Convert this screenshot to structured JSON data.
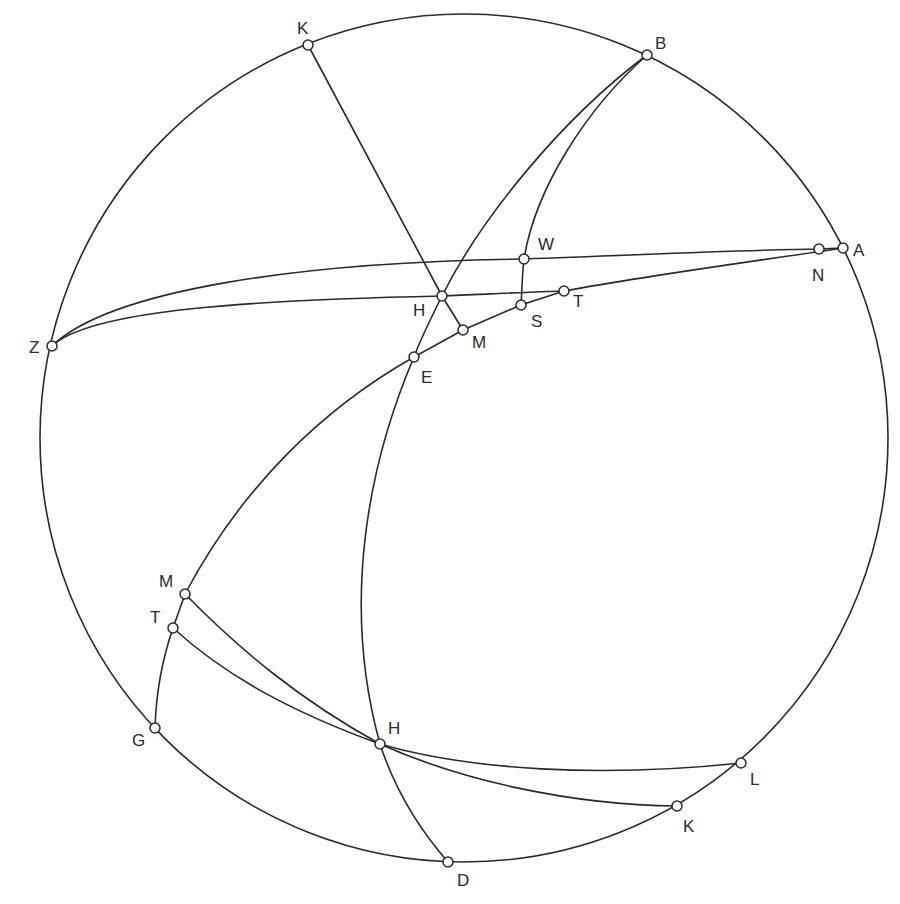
{
  "figure": {
    "type": "spherical-geometry-diagram",
    "circle": {
      "cx": 464,
      "cy": 438,
      "r": 424
    },
    "points": [
      {
        "id": "K_top",
        "label": "K",
        "x": 308,
        "y": 45,
        "lx": 297,
        "ly": 34
      },
      {
        "id": "B",
        "label": "B",
        "x": 647,
        "y": 55,
        "lx": 655,
        "ly": 49
      },
      {
        "id": "A",
        "label": "A",
        "x": 843,
        "y": 248,
        "lx": 853,
        "ly": 256
      },
      {
        "id": "N",
        "label": "N",
        "x": 819,
        "y": 249,
        "lx": 812,
        "ly": 281
      },
      {
        "id": "W",
        "label": "W",
        "x": 524,
        "y": 259,
        "lx": 538,
        "ly": 250
      },
      {
        "id": "T_top",
        "label": "T",
        "x": 564,
        "y": 291,
        "lx": 573,
        "ly": 307
      },
      {
        "id": "S",
        "label": "S",
        "x": 521,
        "y": 305,
        "lx": 531,
        "ly": 327
      },
      {
        "id": "H_top",
        "label": "H",
        "x": 442,
        "y": 296,
        "lx": 413,
        "ly": 316
      },
      {
        "id": "M_top",
        "label": "M",
        "x": 463,
        "y": 330,
        "lx": 472,
        "ly": 348
      },
      {
        "id": "E",
        "label": "E",
        "x": 414,
        "y": 357,
        "lx": 421,
        "ly": 383
      },
      {
        "id": "Z",
        "label": "Z",
        "x": 52,
        "y": 346,
        "lx": 29,
        "ly": 353
      },
      {
        "id": "M_bot",
        "label": "M",
        "x": 185,
        "y": 594,
        "lx": 159,
        "ly": 587
      },
      {
        "id": "T_bot",
        "label": "T",
        "x": 173,
        "y": 628,
        "lx": 150,
        "ly": 623
      },
      {
        "id": "G",
        "label": "G",
        "x": 155,
        "y": 728,
        "lx": 132,
        "ly": 746
      },
      {
        "id": "H_bot",
        "label": "H",
        "x": 380,
        "y": 744,
        "lx": 388,
        "ly": 734
      },
      {
        "id": "L",
        "label": "L",
        "x": 741,
        "y": 763,
        "lx": 750,
        "ly": 785
      },
      {
        "id": "K_bot",
        "label": "K",
        "x": 677,
        "y": 806,
        "lx": 683,
        "ly": 832
      },
      {
        "id": "D",
        "label": "D",
        "x": 448,
        "y": 862,
        "lx": 457,
        "ly": 886
      }
    ]
  }
}
